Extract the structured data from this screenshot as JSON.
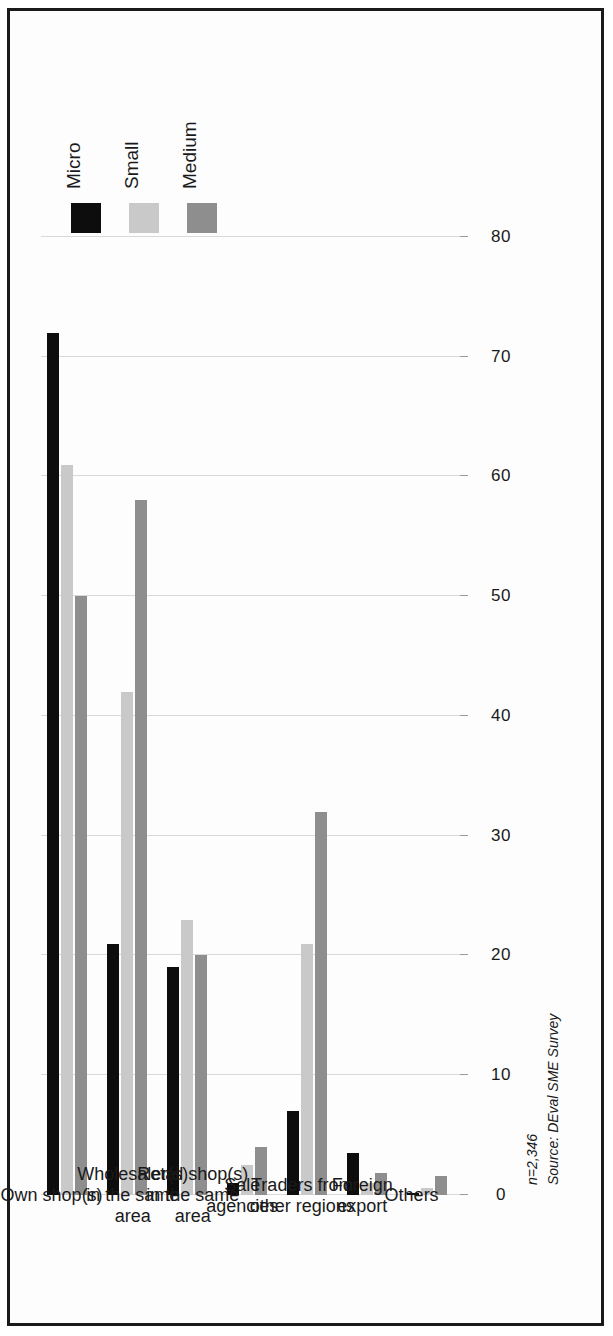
{
  "chart_data": {
    "type": "bar",
    "orientation": "horizontal",
    "title": "",
    "subtitle": "",
    "xlabel": "",
    "ylabel": "",
    "xlim": [
      0,
      80
    ],
    "xticks": [
      0,
      10,
      20,
      30,
      40,
      50,
      60,
      70,
      80
    ],
    "tick_labels": [
      "0",
      "10",
      "20",
      "30",
      "40",
      "50",
      "60",
      "70",
      "80"
    ],
    "grid": true,
    "legend_position": "top-right",
    "categories": [
      "Own shop(s)",
      "Wholesaler(s) in the same area",
      "Retail shop(s) in the same area",
      "Sale agencies",
      "Traders from other regions",
      "Foreign export",
      "Others"
    ],
    "category_lines": [
      [
        "Own shop(s)"
      ],
      [
        "Wholesaler(s)",
        "in the same",
        "area"
      ],
      [
        "Retail shop(s)",
        "in the same",
        "area"
      ],
      [
        "Sale",
        "agencies"
      ],
      [
        "Traders from",
        "other regions"
      ],
      [
        "Foreign",
        "export"
      ],
      [
        "Others"
      ]
    ],
    "series": [
      {
        "name": "Micro",
        "color": "#0d0d0d",
        "values": [
          72,
          21,
          19,
          1.0,
          7,
          3.5,
          0.2
        ]
      },
      {
        "name": "Small",
        "color": "#c9c9c9",
        "values": [
          61,
          42,
          23,
          2.5,
          21,
          1.0,
          0.6
        ]
      },
      {
        "name": "Medium",
        "color": "#8e8e8e",
        "values": [
          50,
          58,
          20,
          4.0,
          32,
          1.8,
          1.6
        ]
      }
    ]
  },
  "legend": {
    "items": [
      {
        "label": "Micro",
        "color": "#0d0d0d"
      },
      {
        "label": "Small",
        "color": "#c9c9c9"
      },
      {
        "label": "Medium",
        "color": "#8e8e8e"
      }
    ]
  },
  "footnote": {
    "sample_size": "n=2,346",
    "source": "Source: DEval SME Survey"
  },
  "colors": {
    "micro": "#0d0d0d",
    "small": "#c9c9c9",
    "medium": "#8e8e8e",
    "grid": "#d9d9d9",
    "axis": "#7a7a7a",
    "text": "#1a1a1a",
    "frame": "#1a1a1a",
    "background": "#ffffff"
  }
}
